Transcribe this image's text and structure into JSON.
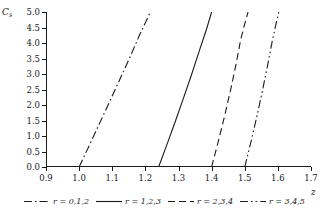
{
  "chart_data": {
    "type": "line",
    "title": "",
    "xlabel": "z",
    "ylabel": "C",
    "ylabel_sub": "s",
    "xlim": [
      0.9,
      1.7
    ],
    "ylim": [
      0.0,
      5.0
    ],
    "grid": false,
    "legend_position": "below",
    "xticks": [
      "0.9",
      "1.0",
      "1.1",
      "1.2",
      "1.3",
      "1.4",
      "1.5",
      "1.6",
      "1.7"
    ],
    "xtick_values": [
      0.9,
      1.0,
      1.1,
      1.2,
      1.3,
      1.4,
      1.5,
      1.6,
      1.7
    ],
    "yticks": [
      "0.0",
      "0.5",
      "1.0",
      "1.5",
      "2.0",
      "2.5",
      "3.0",
      "3.5",
      "4.0",
      "4.5",
      "5.0"
    ],
    "ytick_values": [
      0.0,
      0.5,
      1.0,
      1.5,
      2.0,
      2.5,
      3.0,
      3.5,
      4.0,
      4.5,
      5.0
    ],
    "series": [
      {
        "name": "r = 0,1,2",
        "style": "dashdot",
        "color": "#1a1a1a",
        "x": [
          1.0,
          1.03,
          1.06,
          1.09,
          1.12,
          1.15,
          1.18,
          1.215
        ],
        "values": [
          0.0,
          0.68,
          1.37,
          2.06,
          2.76,
          3.46,
          4.2,
          5.0
        ]
      },
      {
        "name": "r = 1,2,3",
        "style": "solid",
        "color": "#1a1a1a",
        "x": [
          1.24,
          1.265,
          1.29,
          1.315,
          1.34,
          1.365,
          1.385,
          1.4
        ],
        "values": [
          0.0,
          0.72,
          1.46,
          2.22,
          3.0,
          3.82,
          4.46,
          5.0
        ]
      },
      {
        "name": "r = 2,3,4",
        "style": "dashed",
        "color": "#1a1a1a",
        "x": [
          1.4,
          1.42,
          1.44,
          1.458,
          1.474,
          1.488,
          1.5,
          1.51
        ],
        "values": [
          0.0,
          0.82,
          1.68,
          2.52,
          3.33,
          4.12,
          4.62,
          5.0
        ]
      },
      {
        "name": "r = 3,4,5",
        "style": "dashdotdot",
        "color": "#1a1a1a",
        "x": [
          1.5,
          1.518,
          1.536,
          1.553,
          1.569,
          1.583,
          1.594,
          1.603
        ],
        "values": [
          0.0,
          0.78,
          1.6,
          2.44,
          3.28,
          4.06,
          4.6,
          5.0
        ]
      }
    ]
  },
  "legend": {
    "entries": [
      {
        "label": "r = 0,1,2"
      },
      {
        "label": "r = 1,2,3"
      },
      {
        "label": "r = 2,3,4"
      },
      {
        "label": "r = 3,4,5"
      }
    ]
  }
}
